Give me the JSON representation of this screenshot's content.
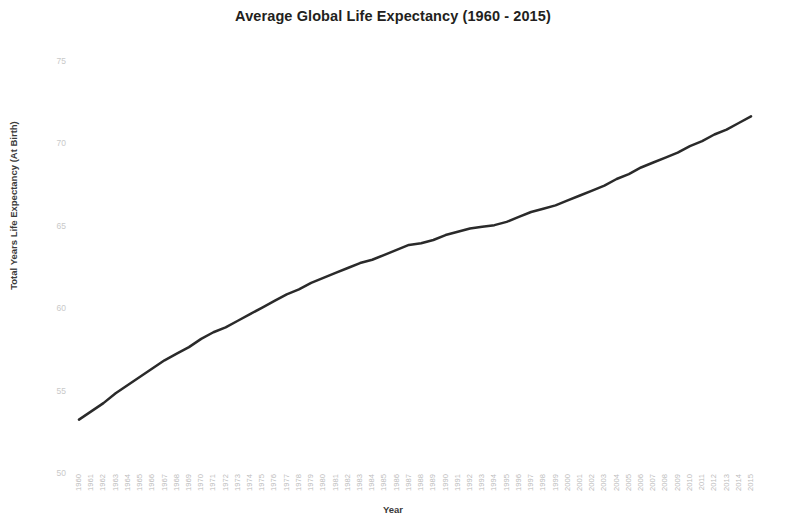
{
  "chart_data": {
    "type": "line",
    "title": "Average Global Life Expectancy (1960 - 2015)",
    "xlabel": "Year",
    "ylabel": "Total Years Life Expectancy (At Birth)",
    "xlim": [
      1960,
      2015
    ],
    "ylim": [
      50,
      75
    ],
    "yticks": [
      50,
      55,
      60,
      65,
      70,
      75
    ],
    "grid": false,
    "legend": false,
    "line_color": "#2a2a2a",
    "line_width": 2.5,
    "x": [
      1960,
      1961,
      1962,
      1963,
      1964,
      1965,
      1966,
      1967,
      1968,
      1969,
      1970,
      1971,
      1972,
      1973,
      1974,
      1975,
      1976,
      1977,
      1978,
      1979,
      1980,
      1981,
      1982,
      1983,
      1984,
      1985,
      1986,
      1987,
      1988,
      1989,
      1990,
      1991,
      1992,
      1993,
      1994,
      1995,
      1996,
      1997,
      1998,
      1999,
      2000,
      2001,
      2002,
      2003,
      2004,
      2005,
      2006,
      2007,
      2008,
      2009,
      2010,
      2011,
      2012,
      2013,
      2014,
      2015
    ],
    "categories": [
      "1960",
      "1961",
      "1962",
      "1963",
      "1964",
      "1965",
      "1966",
      "1967",
      "1968",
      "1969",
      "1970",
      "1971",
      "1972",
      "1973",
      "1974",
      "1975",
      "1976",
      "1977",
      "1978",
      "1979",
      "1980",
      "1981",
      "1982",
      "1983",
      "1984",
      "1985",
      "1986",
      "1987",
      "1988",
      "1989",
      "1990",
      "1991",
      "1992",
      "1993",
      "1994",
      "1995",
      "1996",
      "1997",
      "1998",
      "1999",
      "2000",
      "2001",
      "2002",
      "2003",
      "2004",
      "2005",
      "2006",
      "2007",
      "2008",
      "2009",
      "2010",
      "2011",
      "2012",
      "2013",
      "2014",
      "2015"
    ],
    "values": [
      53.3,
      53.8,
      54.3,
      54.9,
      55.4,
      55.9,
      56.4,
      56.9,
      57.3,
      57.7,
      58.2,
      58.6,
      58.9,
      59.3,
      59.7,
      60.1,
      60.5,
      60.9,
      61.2,
      61.6,
      61.9,
      62.2,
      62.5,
      62.8,
      63.0,
      63.3,
      63.6,
      63.9,
      64.0,
      64.2,
      64.5,
      64.7,
      64.9,
      65.0,
      65.1,
      65.3,
      65.6,
      65.9,
      66.1,
      66.3,
      66.6,
      66.9,
      67.2,
      67.5,
      67.9,
      68.2,
      68.6,
      68.9,
      69.2,
      69.5,
      69.9,
      70.2,
      70.6,
      70.9,
      71.3,
      71.7
    ],
    "series": [
      {
        "name": "Average Global Life Expectancy",
        "values": [
          53.3,
          53.8,
          54.3,
          54.9,
          55.4,
          55.9,
          56.4,
          56.9,
          57.3,
          57.7,
          58.2,
          58.6,
          58.9,
          59.3,
          59.7,
          60.1,
          60.5,
          60.9,
          61.2,
          61.6,
          61.9,
          62.2,
          62.5,
          62.8,
          63.0,
          63.3,
          63.6,
          63.9,
          64.0,
          64.2,
          64.5,
          64.7,
          64.9,
          65.0,
          65.1,
          65.3,
          65.6,
          65.9,
          66.1,
          66.3,
          66.6,
          66.9,
          67.2,
          67.5,
          67.9,
          68.2,
          68.6,
          68.9,
          69.2,
          69.5,
          69.9,
          70.2,
          70.6,
          70.9,
          71.3,
          71.7
        ]
      }
    ]
  }
}
